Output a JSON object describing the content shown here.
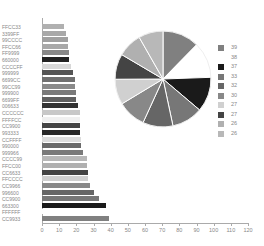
{
  "chart_data": [
    {
      "type": "bar",
      "orientation": "horizontal",
      "title": "",
      "xlabel": "",
      "ylabel": "",
      "xlim": [
        0,
        120
      ],
      "x_ticks": [
        "0",
        "10",
        "20",
        "30",
        "40",
        "50",
        "60",
        "70",
        "80",
        "90",
        "100",
        "110",
        "120"
      ],
      "grid": false,
      "categories": [
        "FFCC33",
        "3399FF",
        "99CCCC",
        "FFCC66",
        "FF9999",
        "660000",
        "CCCCFF",
        "999999",
        "6699CC",
        "99CC99",
        "999900",
        "6699FF",
        "006633",
        "CCCCCC",
        "FFFFCC",
        "CC9900",
        "993333",
        "CCFFFF",
        "990000",
        "999966",
        "CCCC99",
        "FFCC00",
        "CC6633",
        "FFCCCC",
        "CC9966",
        "996600",
        "CC9900",
        "663300",
        "FFFFFF",
        "CC9933"
      ],
      "values": [
        13,
        14,
        15,
        15,
        16,
        16,
        17,
        18,
        19,
        19,
        20,
        20,
        21,
        22,
        22,
        22,
        22,
        23,
        23,
        24,
        26,
        26,
        27,
        27,
        28,
        30,
        33,
        37,
        38,
        39
      ],
      "colors": [
        "#b0b0b0",
        "#a8a8a8",
        "#a0a0a0",
        "#a8a8a8",
        "#888888",
        "#222222",
        "#d8d8d8",
        "#555555",
        "#707070",
        "#8a8a8a",
        "#7a7a7a",
        "#606060",
        "#333333",
        "#c8c8c8",
        "#f0f0f0",
        "#444444",
        "#282828",
        "#dddddd",
        "#6a6a6a",
        "#7a7a7a",
        "#b8b8b8",
        "#b0b0b0",
        "#444444",
        "#d0d0d0",
        "#888888",
        "#666666",
        "#777777",
        "#1a1a1a",
        "#ffffff",
        "#808080"
      ]
    },
    {
      "type": "pie",
      "title": "",
      "legend_position": "right",
      "labels": [
        "39",
        "38",
        "37",
        "33",
        "32",
        "30",
        "27",
        "27",
        "26",
        "26"
      ],
      "values": [
        39,
        38,
        37,
        33,
        32,
        30,
        27,
        27,
        26,
        26
      ],
      "colors": [
        "#808080",
        "#ffffff",
        "#1a1a1a",
        "#777777",
        "#666666",
        "#888888",
        "#d0d0d0",
        "#444444",
        "#b0b0b0",
        "#b8b8b8"
      ]
    }
  ]
}
